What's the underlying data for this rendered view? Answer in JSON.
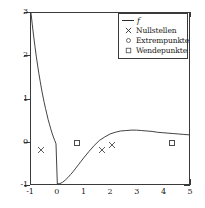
{
  "chart_data": {
    "type": "line",
    "title": "",
    "xlabel": "",
    "ylabel": "",
    "xlim": [
      -1,
      5
    ],
    "ylim": [
      -1,
      3
    ],
    "grid": false,
    "xticks": [
      "-1",
      "0",
      "1",
      "2",
      "3",
      "4",
      "5"
    ],
    "xtick_values": [
      -1,
      0,
      1,
      2,
      3,
      4,
      5
    ],
    "yticks": [
      "3",
      "2",
      "1",
      "0",
      "-1"
    ],
    "ytick_values": [
      3,
      2,
      1,
      0,
      -1
    ],
    "legend_position": "upper right",
    "series": [
      {
        "name": "f",
        "style": "line",
        "x": [
          -1.0,
          -0.95,
          -0.9,
          -0.85,
          -0.8,
          -0.75,
          -0.7,
          -0.65,
          -0.6,
          -0.55,
          -0.5,
          -0.45,
          -0.4,
          -0.35,
          -0.3,
          -0.25,
          -0.2,
          -0.15,
          -0.1,
          -0.05,
          0.0,
          0.1,
          0.2,
          0.3,
          0.4,
          0.5,
          0.6,
          0.7,
          0.8,
          0.9,
          1.0,
          1.2,
          1.4,
          1.6,
          1.8,
          2.0,
          2.2,
          2.4,
          2.6,
          2.8,
          3.0,
          3.2,
          3.4,
          3.6,
          3.8,
          4.0,
          4.2,
          4.4,
          4.6,
          4.8,
          5.0
        ],
        "y": [
          3.0,
          2.72,
          2.46,
          2.22,
          1.99,
          1.78,
          1.58,
          1.4,
          1.22,
          1.06,
          0.91,
          0.77,
          0.64,
          0.51,
          0.4,
          0.29,
          0.19,
          0.1,
          0.02,
          -0.06,
          -1.0,
          -0.99,
          -0.96,
          -0.91,
          -0.85,
          -0.78,
          -0.71,
          -0.63,
          -0.55,
          -0.47,
          -0.39,
          -0.24,
          -0.1,
          0.02,
          0.1,
          0.17,
          0.21,
          0.24,
          0.25,
          0.26,
          0.26,
          0.25,
          0.24,
          0.23,
          0.21,
          0.2,
          0.19,
          0.18,
          0.17,
          0.16,
          0.15
        ]
      },
      {
        "name": "Nullstellen",
        "style": "marker-x",
        "points": [
          {
            "x": -0.62,
            "y": 0.0
          },
          {
            "x": 1.65,
            "y": 0.0
          },
          {
            "x": 2.02,
            "y": 0.12
          }
        ]
      },
      {
        "name": "Extrempunkte",
        "style": "marker-o",
        "points": [
          {
            "x": 0.0,
            "y": -1.0
          }
        ]
      },
      {
        "name": "Wendepunkte",
        "style": "marker-square",
        "points": [
          {
            "x": 0.73,
            "y": 0.0
          },
          {
            "x": 4.3,
            "y": 0.0
          }
        ]
      }
    ],
    "legend": [
      {
        "label": "f",
        "marker": "line",
        "italic": true
      },
      {
        "label": "Nullstellen",
        "marker": "x",
        "italic": false
      },
      {
        "label": "Extrempunkte",
        "marker": "circle",
        "italic": false
      },
      {
        "label": "Wendepunkte",
        "marker": "square",
        "italic": false
      }
    ]
  },
  "colors": {
    "curve": "#2a2a2a",
    "axis": "#3a3a3a",
    "marker": "#4a4a4a",
    "background": "#ffffff"
  }
}
